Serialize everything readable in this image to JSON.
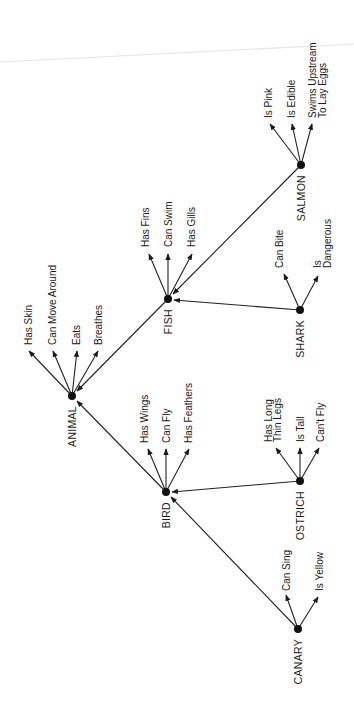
{
  "diagram": {
    "type": "semantic-network",
    "orientation": "rotated-90-ccw",
    "colors": {
      "ink": "#1a1a1a",
      "background": "#ffffff"
    },
    "nodes": [
      {
        "id": "animal",
        "label": "ANIMAL",
        "x": 72,
        "y": 396
      },
      {
        "id": "bird",
        "label": "BIRD",
        "x": 166,
        "y": 492
      },
      {
        "id": "fish",
        "label": "FISH",
        "x": 168,
        "y": 299
      },
      {
        "id": "canary",
        "label": "CANARY",
        "x": 298,
        "y": 629
      },
      {
        "id": "ostrich",
        "label": "OSTRICH",
        "x": 300,
        "y": 481
      },
      {
        "id": "shark",
        "label": "SHARK",
        "x": 300,
        "y": 310
      },
      {
        "id": "salmon",
        "label": "SALMON",
        "x": 301,
        "y": 165
      }
    ],
    "isa_links": [
      {
        "from": "bird",
        "to": "animal"
      },
      {
        "from": "fish",
        "to": "animal"
      },
      {
        "from": "canary",
        "to": "bird"
      },
      {
        "from": "ostrich",
        "to": "bird"
      },
      {
        "from": "shark",
        "to": "fish"
      },
      {
        "from": "salmon",
        "to": "fish"
      }
    ],
    "properties": {
      "animal": [
        "Has Skin",
        "Can Move Around",
        "Eats",
        "Breathes"
      ],
      "bird": [
        "Has Wings",
        "Can Fly",
        "Has Feathers"
      ],
      "fish": [
        "Has Fins",
        "Can Swim",
        "Has Gills"
      ],
      "canary": [
        "Can Sing",
        "Is Yellow"
      ],
      "ostrich": [
        "Has Long Thin Legs",
        "Is Tall",
        "Can't Fly"
      ],
      "shark": [
        "Can Bite",
        "Is Dangerous"
      ],
      "salmon": [
        "Is Pink",
        "Is Edible",
        "Swims Upstream To Lay Eggs"
      ]
    }
  },
  "labels": {
    "animal": "ANIMAL",
    "bird": "BIRD",
    "fish": "FISH",
    "canary": "CANARY",
    "ostrich": "OSTRICH",
    "shark": "SHARK",
    "salmon": "SALMON",
    "animal_p0": "Has Skin",
    "animal_p1": "Can Move Around",
    "animal_p2": "Eats",
    "animal_p3": "Breathes",
    "bird_p0": "Has Wings",
    "bird_p1": "Can Fly",
    "bird_p2": "Has Feathers",
    "fish_p0": "Has Fins",
    "fish_p1": "Can Swim",
    "fish_p2": "Has Gills",
    "canary_p0": "Can Sing",
    "canary_p1": "Is Yellow",
    "ostrich_p0_l1": "Has Long",
    "ostrich_p0_l2": "Thin Legs",
    "ostrich_p1": "Is Tall",
    "ostrich_p2": "Can't Fly",
    "shark_p0": "Can Bite",
    "shark_p1_l1": "Is",
    "shark_p1_l2": "Dangerous",
    "salmon_p0": "Is Pink",
    "salmon_p1": "Is Edible",
    "salmon_p2_l1": "Swims Upstream",
    "salmon_p2_l2": "To Lay Eggs"
  }
}
